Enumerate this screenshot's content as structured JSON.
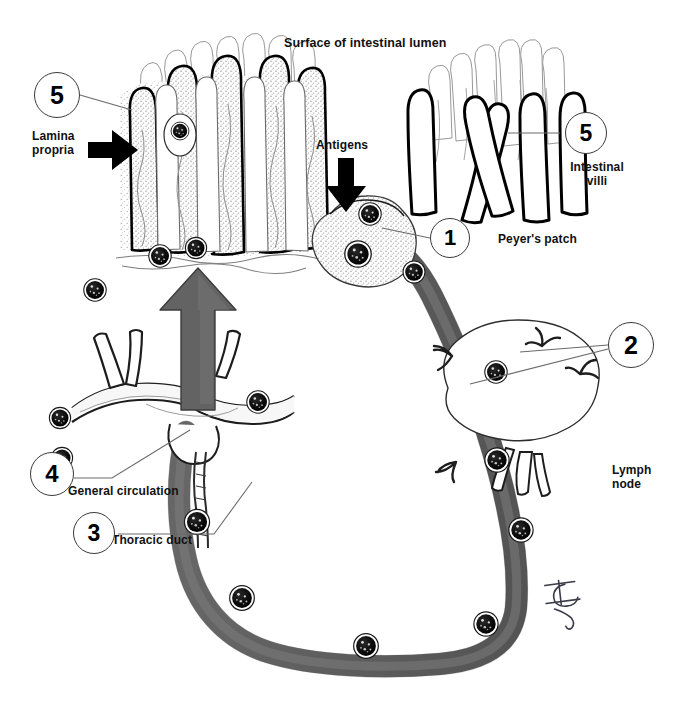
{
  "figure": {
    "title_text": "Surface of intestinal lumen",
    "domain_note": "Mucosal immune system / lymphocyte recirculation diagram",
    "colors": {
      "ink": "#000000",
      "paper": "#ffffff",
      "vessel_gray": "#6b6b6b",
      "vessel_gray_dark": "#5a5a5a",
      "tissue_stipple": "#bdbdbd",
      "leader_line": "#555555"
    }
  },
  "labels": {
    "surface_of_lumen": "Surface of intestinal lumen",
    "lamina_propria": "Lamina\npropria",
    "antigens": "Antigens",
    "peyers_patch": "Peyer's patch",
    "intestinal_villi": "Intestinal\nvilli",
    "lymph_node": "Lymph\nnode",
    "general_circulation": "General circulation",
    "thoracic_duct": "Thoracic duct",
    "signature": "H"
  },
  "callouts": [
    {
      "id": "c1",
      "number": "1",
      "target": "peyers_patch",
      "x": 430,
      "y": 218,
      "d": 40
    },
    {
      "id": "c2",
      "number": "2",
      "target": "lymph_node",
      "x": 608,
      "y": 322,
      "d": 46
    },
    {
      "id": "c3",
      "number": "3",
      "target": "thoracic_duct",
      "x": 73,
      "y": 512,
      "d": 42
    },
    {
      "id": "c4",
      "number": "4",
      "target": "general_circulation",
      "x": 30,
      "y": 452,
      "d": 44
    },
    {
      "id": "c5a",
      "number": "5",
      "target": "lamina_propria",
      "x": 34,
      "y": 72,
      "d": 46
    },
    {
      "id": "c5b",
      "number": "5",
      "target": "intestinal_villi",
      "x": 565,
      "y": 112,
      "d": 42
    }
  ],
  "structures": [
    {
      "name": "left-villi-cluster",
      "description": "Intestinal villi with lamina propria, stippled core"
    },
    {
      "name": "right-villi-cluster",
      "description": "Intestinal villi, outline only"
    },
    {
      "name": "peyers-patch",
      "description": "Stippled lymphoid follicle below lumen surface"
    },
    {
      "name": "lymph-node",
      "description": "Bean shaped node with afferent/efferent vessels"
    },
    {
      "name": "thoracic-duct",
      "description": "Lymphatic duct joining venous circulation"
    },
    {
      "name": "general-circulation",
      "description": "Great vessels / subclavian junction"
    },
    {
      "name": "lymphatic-loop",
      "description": "Gray recirculation vessel loop with lymphocytes"
    },
    {
      "name": "antigen-arrow",
      "description": "Black downward arrow into Peyer's patch"
    },
    {
      "name": "lamina-propria-arrow",
      "description": "Black rightward arrow into lamina propria"
    },
    {
      "name": "homing-arrow",
      "description": "Large gray upward arrow back to gut mucosa"
    }
  ],
  "lymphocytes": {
    "count": 16,
    "description": "Dark stippled round lymphocytes distributed along vessels and tissue"
  }
}
